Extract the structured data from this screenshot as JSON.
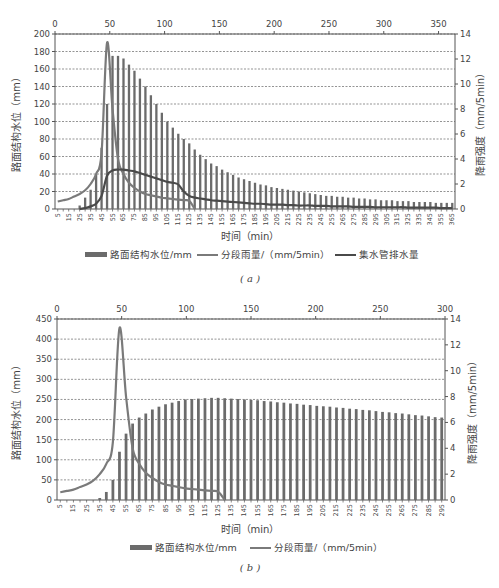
{
  "chart_data": [
    {
      "id": "a",
      "type": "bar+line",
      "subtitle": "( a )",
      "xlabel": "时间（min）",
      "ylabel": "路面结构水位（mm）",
      "y2label": "降雨强度（mm/5min）",
      "top_axis": {
        "range": [
          0,
          365
        ],
        "ticks": [
          0,
          50,
          100,
          150,
          200,
          250,
          300,
          350
        ]
      },
      "ylim": [
        0,
        200
      ],
      "yticks": [
        0,
        20,
        40,
        60,
        80,
        100,
        120,
        140,
        160,
        180,
        200
      ],
      "y2lim": [
        0,
        14
      ],
      "y2ticks": [
        0,
        2,
        4,
        6,
        8,
        10,
        12,
        14
      ],
      "grid": "horizontal dashed",
      "legend_position": "bottom",
      "categories": [
        5,
        10,
        15,
        20,
        25,
        30,
        35,
        40,
        45,
        50,
        55,
        60,
        65,
        70,
        75,
        80,
        85,
        90,
        95,
        100,
        105,
        110,
        115,
        120,
        125,
        130,
        135,
        140,
        145,
        150,
        155,
        160,
        165,
        170,
        175,
        180,
        185,
        190,
        195,
        200,
        205,
        210,
        215,
        220,
        225,
        230,
        235,
        240,
        245,
        250,
        255,
        260,
        265,
        270,
        275,
        280,
        285,
        290,
        295,
        300,
        305,
        310,
        315,
        320,
        325,
        330,
        335,
        340,
        345,
        350,
        355,
        360,
        365
      ],
      "series": [
        {
          "name": "路面结构水位/mm",
          "kind": "bar",
          "axis": "left",
          "values": [
            0,
            0,
            0,
            0,
            4,
            13,
            22,
            40,
            70,
            120,
            175,
            175,
            172,
            165,
            158,
            149,
            140,
            130,
            120,
            110,
            100,
            93,
            86,
            80,
            75,
            68,
            62,
            57,
            52,
            49,
            45,
            42,
            39,
            36,
            34,
            32,
            30,
            28,
            27,
            25,
            24,
            23,
            22,
            21,
            20,
            19,
            18,
            17,
            16,
            15,
            15,
            14,
            14,
            13,
            13,
            12,
            12,
            11,
            11,
            10,
            10,
            10,
            9,
            9,
            9,
            8,
            8,
            8,
            8,
            7,
            7,
            7,
            7
          ]
        },
        {
          "name": "分段雨量/（mm/5min）",
          "kind": "line",
          "axis": "right",
          "values": [
            0.6,
            0.7,
            0.8,
            1.0,
            1.2,
            1.5,
            2.0,
            2.8,
            4.5,
            13.3,
            8.0,
            4.0,
            2.8,
            2.1,
            1.7,
            1.4,
            1.2,
            1.1,
            1.0,
            0.9,
            0.85,
            0.8,
            0.75,
            0.7,
            0.65,
            0,
            0,
            0,
            0,
            0,
            0,
            0,
            0,
            0,
            0,
            0,
            0,
            0,
            0,
            0,
            0,
            0,
            0,
            0,
            0,
            0,
            0,
            0,
            0,
            0,
            0,
            0,
            0,
            0,
            0,
            0,
            0,
            0,
            0,
            0,
            0,
            0,
            0,
            0,
            0,
            0,
            0,
            0,
            0,
            0,
            0,
            0,
            0
          ]
        },
        {
          "name": "集水管排水量",
          "kind": "line",
          "axis": "left",
          "values": [
            null,
            null,
            null,
            null,
            0,
            1,
            3,
            6,
            15,
            38,
            44,
            45,
            45,
            44,
            43,
            41,
            39,
            37,
            35,
            33,
            31,
            30,
            28,
            20,
            15,
            13,
            12,
            11,
            10,
            9.5,
            9,
            8.5,
            8,
            7.5,
            7,
            6.5,
            6,
            6,
            5.5,
            5,
            5,
            5,
            4.5,
            4.5,
            4,
            4,
            4,
            3.5,
            3.5,
            3.5,
            3,
            3,
            3,
            3,
            2.5,
            2.5,
            2.5,
            2.5,
            2,
            2,
            2,
            2,
            2,
            2,
            1.5,
            1.5,
            1.5,
            1.5,
            1.5,
            1.5,
            1,
            1,
            1
          ]
        }
      ]
    },
    {
      "id": "b",
      "type": "bar+line",
      "subtitle": "( b )",
      "xlabel": "时间（min）",
      "ylabel": "路面结构水位（mm）",
      "y2label": "降雨强度（mm/5min）",
      "top_axis": {
        "range": [
          0,
          300
        ],
        "ticks": [
          0,
          50,
          100,
          150,
          200,
          250,
          300
        ]
      },
      "ylim": [
        0,
        450
      ],
      "yticks": [
        0,
        50,
        100,
        150,
        200,
        250,
        300,
        350,
        400,
        450
      ],
      "y2lim": [
        0,
        14
      ],
      "y2ticks": [
        0,
        2,
        4,
        6,
        8,
        10,
        12,
        14
      ],
      "grid": "horizontal dashed",
      "legend_position": "bottom",
      "categories": [
        5,
        10,
        15,
        20,
        25,
        30,
        35,
        40,
        45,
        50,
        55,
        60,
        65,
        70,
        75,
        80,
        85,
        90,
        95,
        100,
        105,
        110,
        115,
        120,
        125,
        130,
        135,
        140,
        145,
        150,
        155,
        160,
        165,
        170,
        175,
        180,
        185,
        190,
        195,
        200,
        205,
        210,
        215,
        220,
        225,
        230,
        235,
        240,
        245,
        250,
        255,
        260,
        265,
        270,
        275,
        280,
        285,
        290,
        295
      ],
      "series": [
        {
          "name": "路面结构水位/mm",
          "kind": "bar",
          "axis": "left",
          "values": [
            0,
            0,
            0,
            0,
            0,
            0,
            5,
            20,
            50,
            120,
            165,
            190,
            205,
            215,
            225,
            232,
            238,
            242,
            246,
            250,
            251,
            252,
            253,
            254,
            254,
            253,
            252,
            251,
            250,
            249,
            248,
            246,
            245,
            243,
            242,
            240,
            239,
            237,
            236,
            234,
            233,
            232,
            230,
            229,
            227,
            226,
            224,
            223,
            221,
            219,
            218,
            216,
            215,
            213,
            211,
            210,
            208,
            206,
            205
          ]
        },
        {
          "name": "分段雨量/（mm/5min）",
          "kind": "line",
          "axis": "right",
          "values": [
            0.6,
            0.7,
            0.8,
            1.0,
            1.2,
            1.5,
            2.0,
            2.8,
            4.5,
            13.3,
            8.0,
            4.0,
            2.8,
            2.1,
            1.7,
            1.4,
            1.2,
            1.1,
            1.0,
            0.9,
            0.85,
            0.8,
            0.75,
            0.7,
            0.65,
            0,
            0,
            0,
            0,
            0,
            0,
            0,
            0,
            0,
            0,
            0,
            0,
            0,
            0,
            0,
            0,
            0,
            0,
            0,
            0,
            0,
            0,
            0,
            0,
            0,
            0,
            0,
            0,
            0,
            0,
            0,
            0,
            0,
            0
          ]
        }
      ]
    }
  ],
  "legend_a": {
    "item1": "路面结构水位/mm",
    "item2": "分段雨量/（mm/5min）",
    "item3": "集水管排水量"
  },
  "legend_b": {
    "item1": "路面结构水位/mm",
    "item2": "分段雨量/（mm/5min）"
  },
  "labels": {
    "xlabel_a": "时间（min）",
    "xlabel_b": "时间（min）",
    "ylabel": "路面结构水位（mm）",
    "y2label": "降雨强度（mm/5min）",
    "sub_a": "( a )",
    "sub_b": "( b )"
  },
  "colors": {
    "bar": "#6b6b6b",
    "rain_line": "#7a7a7a",
    "drain_line": "#4a4a4a",
    "axis": "#555555",
    "grid": "#666666"
  }
}
